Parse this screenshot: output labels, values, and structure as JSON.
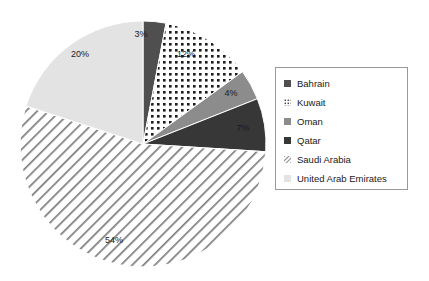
{
  "chart_data": {
    "type": "pie",
    "title": "",
    "subtitle": "",
    "xlabel": "",
    "ylabel": "",
    "legend_position": "right",
    "grid": false,
    "categories": [
      "Bahrain",
      "Kuwait",
      "Oman",
      "Qatar",
      "Saudi Arabia",
      "United Arab Emirates"
    ],
    "values": [
      3,
      12,
      4,
      7,
      54,
      20
    ],
    "value_unit": "%",
    "slices": [
      {
        "label": "Bahrain",
        "value": 3,
        "data_label": "3%",
        "fill": "#4f4f4f",
        "pattern": "solid-dark-gray",
        "label_x": 141,
        "label_y": 37
      },
      {
        "label": "Kuwait",
        "value": 12,
        "data_label": "12%",
        "fill": "#ffffff",
        "pattern": "dots-black-on-white",
        "label_x": 186,
        "label_y": 57
      },
      {
        "label": "Oman",
        "value": 4,
        "data_label": "4%",
        "fill": "#8c8c8c",
        "pattern": "solid-medium-gray",
        "label_x": 231,
        "label_y": 96
      },
      {
        "label": "Qatar",
        "value": 7,
        "data_label": "7%",
        "fill": "#373737",
        "pattern": "solid-near-black",
        "label_x": 243,
        "label_y": 131
      },
      {
        "label": "Saudi Arabia",
        "value": 54,
        "data_label": "54%",
        "fill": "#ffffff",
        "pattern": "diagonal-hatch-gray",
        "label_x": 114,
        "label_y": 243
      },
      {
        "label": "United Arab Emirates",
        "value": 20,
        "data_label": "20%",
        "fill": "#e3e3e3",
        "pattern": "solid-light-gray",
        "label_x": 80,
        "label_y": 57
      }
    ],
    "geometry": {
      "center_x": 143,
      "center_y": 144,
      "radius": 123,
      "start_angle_deg": 0,
      "direction": "clockwise"
    }
  },
  "legend": {
    "items": [
      {
        "label": "Bahrain",
        "swatch": "swatch-solid-dark-gray"
      },
      {
        "label": "Kuwait",
        "swatch": "swatch-dots"
      },
      {
        "label": "Oman",
        "swatch": "swatch-solid-medium-gray"
      },
      {
        "label": "Qatar",
        "swatch": "swatch-solid-near-black"
      },
      {
        "label": "Saudi Arabia",
        "swatch": "swatch-hatch"
      },
      {
        "label": "United Arab Emirates",
        "swatch": "swatch-solid-light-gray"
      }
    ]
  },
  "colors": {
    "bahrain": "#4f4f4f",
    "kuwait": "#ffffff",
    "oman": "#8c8c8c",
    "qatar": "#373737",
    "saudi_arabia": "#ffffff",
    "united_arab_emirates": "#e3e3e3",
    "legend_border": "#999999",
    "slice_outline": "#ffffff",
    "text": "#1a1a1a",
    "background": "#ffffff"
  }
}
